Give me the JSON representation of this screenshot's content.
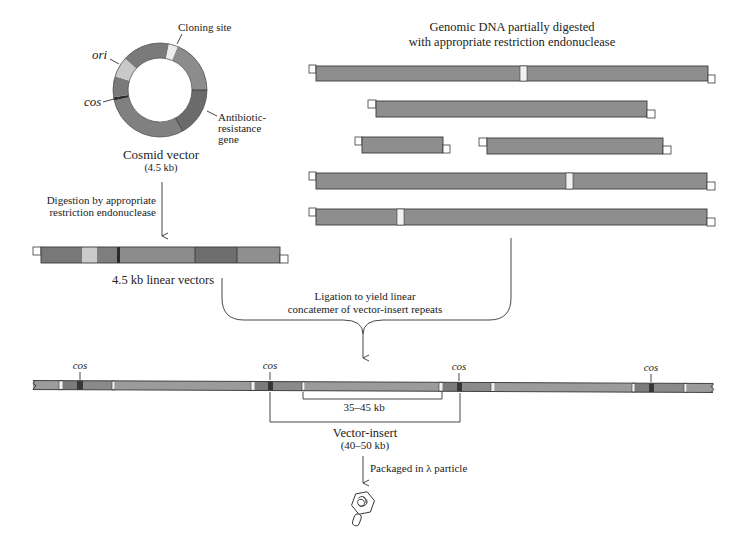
{
  "figure": {
    "cosmid_vector": {
      "cloning_site_label": "Cloning site",
      "ori_label": "ori",
      "cos_label": "cos",
      "resistance_label": [
        "Antibiotic-",
        "resistance",
        "gene"
      ],
      "title": "Cosmid vector",
      "size": "(4.5 kb)"
    },
    "digestion_step": [
      "Digestion by appropriate",
      "restriction endonuclease"
    ],
    "linear_vectors_label": "4.5 kb linear vectors",
    "genomic_dna": [
      "Genomic DNA partially digested",
      "with appropriate restriction endonuclease"
    ],
    "ligation_step": [
      "Ligation to yield linear",
      "concatemer of vector-insert repeats"
    ],
    "concatemer": {
      "cos_labels": [
        "cos",
        "cos",
        "cos",
        "cos"
      ],
      "insert_size": "35–45 kb",
      "vector_insert_label": "Vector-insert",
      "vector_insert_size": "(40–50 kb)"
    },
    "packaging_step": "Packaged in λ particle"
  },
  "colors": {
    "dna_segment": "#8e8e8e",
    "vector_dark": "#6b6b6b",
    "ori_segment": "#c9c9c9",
    "cos_site": "#363636",
    "cloning_site": "#ececec",
    "line": "#333333"
  }
}
